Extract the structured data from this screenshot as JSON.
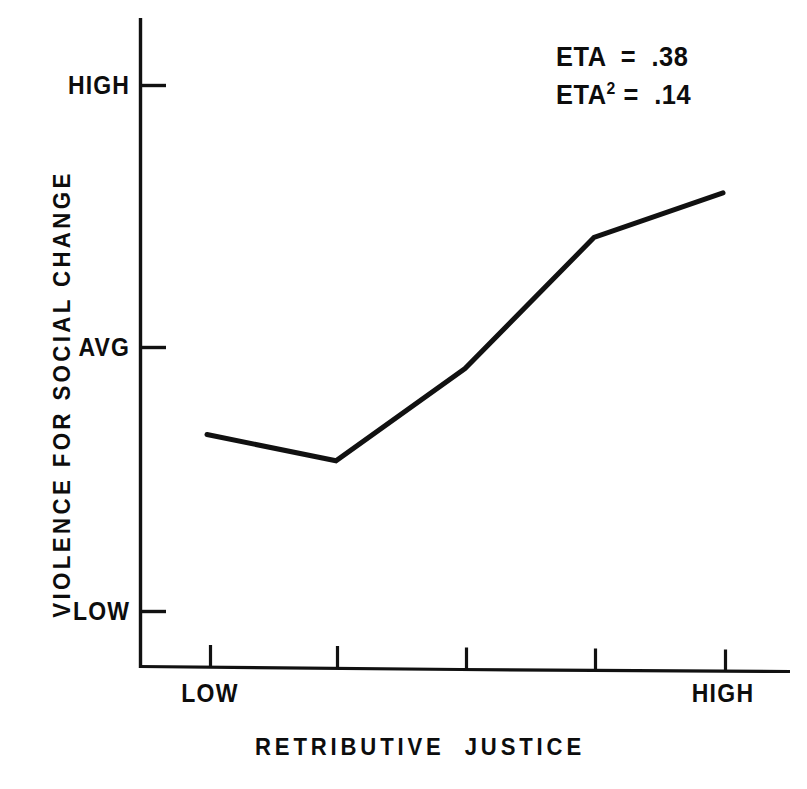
{
  "figure": {
    "background_color": "#ffffff",
    "ink_color": "#111111"
  },
  "chart_data": {
    "type": "line",
    "title": "",
    "xlabel": "RETRIBUTIVE  JUSTICE",
    "ylabel": "VIOLENCE FOR SOCIAL CHANGE",
    "x": [
      1,
      2,
      3,
      4,
      5
    ],
    "x_tick_labels": [
      "LOW",
      "",
      "",
      "",
      "HIGH"
    ],
    "y_tick_labels": [
      "LOW",
      "AVG",
      "HIGH"
    ],
    "y_tick_values": [
      0,
      1,
      2
    ],
    "ylim": [
      -0.22,
      2.22
    ],
    "xlim": [
      0.45,
      5.5
    ],
    "grid": false,
    "legend": false,
    "series": [
      {
        "name": "Violence for social change",
        "values": [
          0.67,
          0.57,
          0.92,
          1.42,
          1.59
        ],
        "color": "#111111",
        "line_width": 5,
        "markers": false
      }
    ],
    "annotations": [
      {
        "text": "ETA  =  .38",
        "position": "top-right"
      },
      {
        "text": "ETA² =  .14",
        "position": "top-right"
      }
    ]
  },
  "axes": {
    "y_ticks": [
      {
        "label": "HIGH",
        "value": 2
      },
      {
        "label": "AVG",
        "value": 1
      },
      {
        "label": "LOW",
        "value": 0
      }
    ],
    "x_ticks": [
      {
        "label": "LOW",
        "value": 1
      },
      {
        "label": "",
        "value": 2
      },
      {
        "label": "",
        "value": 3
      },
      {
        "label": "",
        "value": 4
      },
      {
        "label": "HIGH",
        "value": 5
      }
    ],
    "x_title": "RETRIBUTIVE  JUSTICE",
    "y_title": "VIOLENCE FOR SOCIAL CHANGE"
  },
  "stats": {
    "eta_label": "ETA",
    "eta_equals": "  =  ",
    "eta_value": ".38",
    "eta_sq_label": "ETA",
    "eta_sq_exponent": "2",
    "eta_sq_equals": " =  ",
    "eta_sq_value": ".14"
  }
}
